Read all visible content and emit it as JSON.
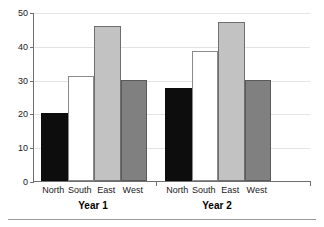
{
  "chart_data": {
    "type": "bar",
    "title": "",
    "subtitle": "",
    "xlabel": "",
    "ylabel": "",
    "ylim": [
      0,
      50
    ],
    "ytick_values": [
      0,
      10,
      20,
      30,
      40,
      50
    ],
    "ytick_labels": [
      "0",
      "10",
      "20",
      "30",
      "40",
      "50"
    ],
    "grid": true,
    "grid_axis": "y",
    "legend": false,
    "legend_position": "none",
    "categories": [
      "North",
      "South",
      "East",
      "West"
    ],
    "groups": [
      "Year 1",
      "Year 2"
    ],
    "series": [
      {
        "name": "Year 1",
        "values": [
          20,
          31,
          46,
          30
        ]
      },
      {
        "name": "Year 2",
        "values": [
          27.5,
          38.5,
          47,
          30
        ]
      }
    ],
    "bar_colors": {
      "North": "#0d0d0d",
      "South": "#ffffff",
      "East": "#c2c2c2",
      "West": "#808080"
    },
    "axis_color": "#6f6f6f",
    "grid_color": "#e3e3e3"
  },
  "axis": {
    "y_ticks": [
      {
        "label": "50",
        "value": 50
      },
      {
        "label": "40",
        "value": 40
      },
      {
        "label": "30",
        "value": 30
      },
      {
        "label": "20",
        "value": 20
      },
      {
        "label": "10",
        "value": 10
      },
      {
        "label": "0",
        "value": 0
      }
    ]
  },
  "bars": [
    {
      "group": "Year 1",
      "category": "North",
      "value": 20,
      "swatch": "north"
    },
    {
      "group": "Year 1",
      "category": "South",
      "value": 31,
      "swatch": "south"
    },
    {
      "group": "Year 1",
      "category": "East",
      "value": 46,
      "swatch": "east"
    },
    {
      "group": "Year 1",
      "category": "West",
      "value": 30,
      "swatch": "west"
    },
    {
      "group": "Year 2",
      "category": "North",
      "value": 27.5,
      "swatch": "north"
    },
    {
      "group": "Year 2",
      "category": "South",
      "value": 38.5,
      "swatch": "south"
    },
    {
      "group": "Year 2",
      "category": "East",
      "value": 47,
      "swatch": "east"
    },
    {
      "group": "Year 2",
      "category": "West",
      "value": 30,
      "swatch": "west"
    }
  ],
  "category_labels": [
    "North",
    "South",
    "East",
    "West",
    "North",
    "South",
    "East",
    "West"
  ],
  "group_labels": [
    "Year 1",
    "Year 2"
  ]
}
